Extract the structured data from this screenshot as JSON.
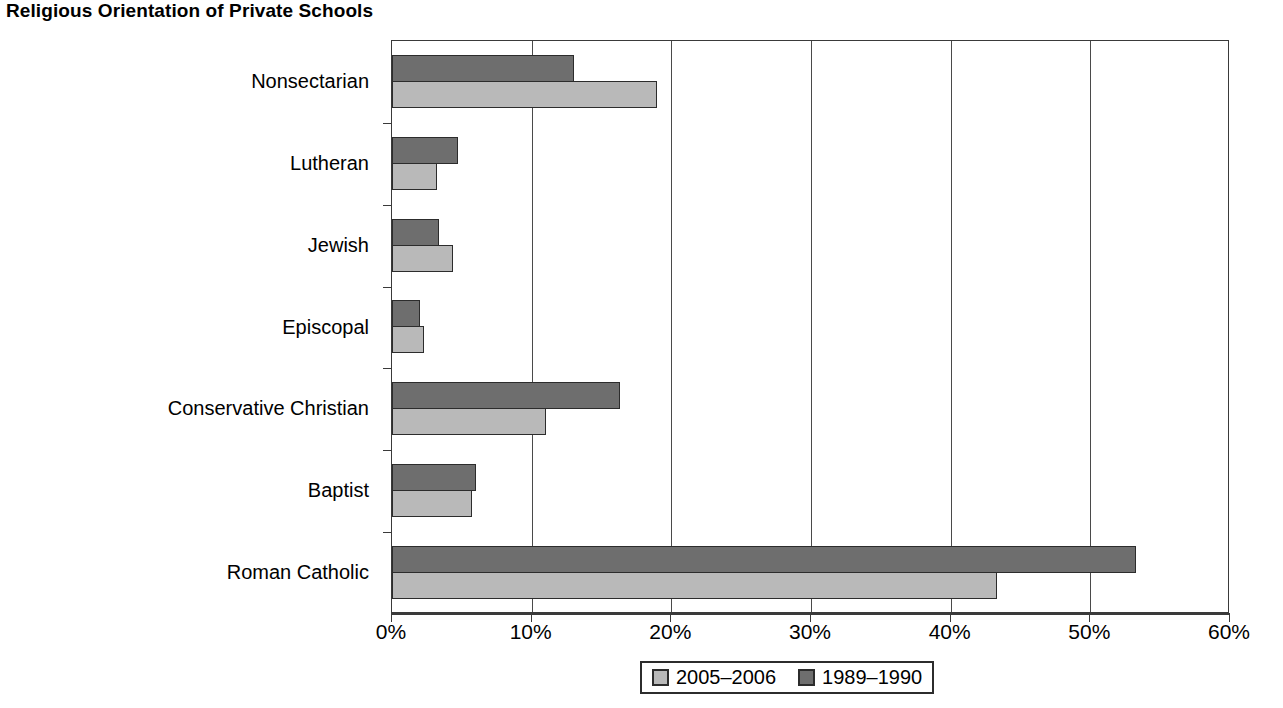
{
  "title": "Religious Orientation of Private Schools",
  "legend": {
    "position": "bottom-center",
    "entries": [
      {
        "label": "2005–2006",
        "swatch": "light-gray-swatch-icon",
        "color": "#b9b9b9"
      },
      {
        "label": "1989–1990",
        "swatch": "dark-gray-swatch-icon",
        "color": "#6e6e6e"
      }
    ]
  },
  "axis": {
    "x_ticks": [
      "0%",
      "10%",
      "20%",
      "30%",
      "40%",
      "50%",
      "60%"
    ],
    "x_min": 0,
    "x_max": 60
  },
  "chart_data": {
    "type": "bar",
    "orientation": "horizontal",
    "title": "Religious Orientation of Private Schools",
    "xlabel": "",
    "ylabel": "",
    "xlim": [
      0,
      60
    ],
    "xticks": [
      0,
      10,
      20,
      30,
      40,
      50,
      60
    ],
    "xtick_labels": [
      "0%",
      "10%",
      "20%",
      "30%",
      "40%",
      "50%",
      "60%"
    ],
    "grid": true,
    "legend_position": "bottom-center",
    "categories": [
      "Nonsectarian",
      "Lutheran",
      "Jewish",
      "Episcopal",
      "Conservative Christian",
      "Baptist",
      "Roman Catholic"
    ],
    "series": [
      {
        "name": "2005–2006",
        "color": "#b9b9b9",
        "values": [
          19.0,
          3.2,
          4.4,
          2.3,
          11.0,
          5.7,
          43.3
        ]
      },
      {
        "name": "1989–1990",
        "color": "#6e6e6e",
        "values": [
          13.0,
          4.7,
          3.4,
          2.0,
          16.3,
          6.0,
          53.3
        ]
      }
    ]
  }
}
